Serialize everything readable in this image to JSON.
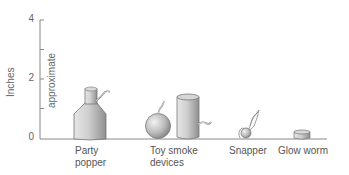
{
  "diagram": {
    "y_axis": {
      "label": "Inches",
      "sublabel": "approximate",
      "ticks": [
        "0",
        "2",
        "4"
      ],
      "range": [
        0,
        4
      ]
    },
    "items": [
      {
        "label_line1": "Party",
        "label_line2": "popper",
        "icon": "party-popper-bottle",
        "approx_height_in": 1.7
      },
      {
        "label_line1": "Toy smoke",
        "label_line2": "devices",
        "icon": "smoke-ball-and-cylinder",
        "approx_height_in": 1.5
      },
      {
        "label_line1": "Snapper",
        "label_line2": "",
        "icon": "snapper",
        "approx_height_in": 1.0
      },
      {
        "label_line1": "Glow worm",
        "label_line2": "",
        "icon": "glow-worm-disc",
        "approx_height_in": 0.3
      }
    ],
    "colors": {
      "axis": "#888888",
      "object_fill": "#bdbdbd",
      "object_stroke": "#777777"
    }
  }
}
